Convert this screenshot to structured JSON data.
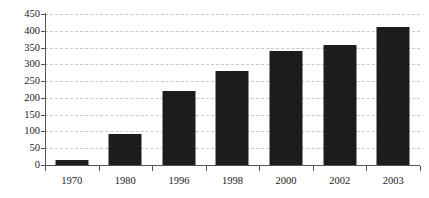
{
  "chart_data": {
    "type": "bar",
    "title": "",
    "subtitle": "",
    "xlabel": "",
    "ylabel": "",
    "categories": [
      "1970",
      "1980",
      "1996",
      "1998",
      "2000",
      "2002",
      "2003"
    ],
    "values": [
      15,
      92,
      220,
      280,
      340,
      358,
      410
    ],
    "series": [
      {
        "name": "",
        "values": [
          15,
          92,
          220,
          280,
          340,
          358,
          410
        ]
      }
    ],
    "ylim": [
      0,
      450
    ],
    "yticks": [
      0,
      50,
      100,
      150,
      200,
      250,
      300,
      350,
      400,
      450
    ],
    "ytick_labels": [
      "0",
      "50",
      "100",
      "150",
      "200",
      "250",
      "300",
      "350",
      "400",
      "450"
    ],
    "grid": true,
    "grid_axis": "y",
    "grid_style": "dashed",
    "legend": false,
    "legend_position": "none",
    "bar_color": "#1c1c1c",
    "gridline_color": "#c9c9c9",
    "axis_color": "#555555",
    "background_color": "#ffffff",
    "text_color": "#1a1a1a"
  }
}
